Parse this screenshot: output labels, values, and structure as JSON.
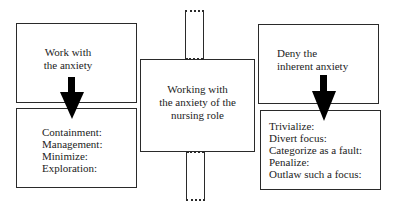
{
  "diagram": {
    "center": {
      "lines": [
        "Working with",
        "the anxiety of the",
        "nursing role"
      ]
    },
    "left": {
      "header_lines": [
        "Work with",
        "the anxiety"
      ],
      "items": [
        "Containment:",
        "Management:",
        "Minimize:",
        "Exploration:"
      ]
    },
    "right": {
      "header_lines": [
        "Deny the",
        "inherent anxiety"
      ],
      "items": [
        "Trivialize:",
        "Divert focus:",
        "Categorize as a fault:",
        "Penalize:",
        "Outlaw such a focus:"
      ]
    },
    "icons": {
      "left_arrow": "down-arrow",
      "right_arrow": "down-arrow"
    },
    "colors": {
      "stroke": "#2a2a2a",
      "arrow_fill": "#000000",
      "background": "#ffffff"
    }
  }
}
